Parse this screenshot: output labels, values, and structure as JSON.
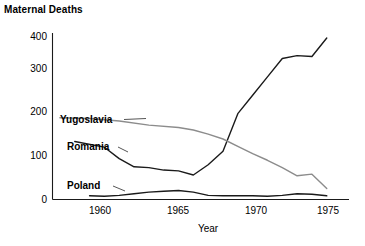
{
  "chart_data": {
    "type": "line",
    "title": "Maternal Deaths",
    "xlabel": "Year",
    "ylabel": "",
    "xlim": [
      1956.5,
      1976.5
    ],
    "ylim": [
      0,
      400
    ],
    "grid": false,
    "legend_position": "inline-annotations",
    "xticks": [
      1960,
      1965,
      1970,
      1975
    ],
    "yticks": [
      0,
      100,
      200,
      300,
      400
    ],
    "xtick_labels": [
      "1960",
      "1965",
      "1970",
      "1975"
    ],
    "ytick_labels": [
      "0",
      "100",
      "200",
      "300",
      "400"
    ],
    "series": [
      {
        "name": "Romania",
        "color": "#1a1a1a",
        "x": [
          1958,
          1960,
          1961,
          1962,
          1963,
          1964,
          1965,
          1966,
          1967,
          1968,
          1969,
          1970,
          1971,
          1972,
          1973,
          1974,
          1975
        ],
        "values": [
          142,
          128,
          100,
          80,
          78,
          72,
          70,
          60,
          85,
          118,
          210,
          255,
          300,
          345,
          352,
          350,
          395
        ]
      },
      {
        "name": "Yugoslavia",
        "color": "#8c8c8c",
        "x": [
          1957,
          1959,
          1961,
          1963,
          1965,
          1966,
          1967,
          1968,
          1969,
          1970,
          1971,
          1972,
          1973,
          1974,
          1975
        ],
        "values": [
          200,
          198,
          192,
          182,
          176,
          170,
          160,
          148,
          130,
          112,
          96,
          78,
          58,
          62,
          27
        ]
      },
      {
        "name": "Poland",
        "color": "#1a1a1a",
        "x": [
          1959,
          1960,
          1961,
          1962,
          1963,
          1964,
          1965,
          1966,
          1967,
          1968,
          1969,
          1970,
          1971,
          1972,
          1973,
          1974,
          1975
        ],
        "values": [
          9,
          8,
          10,
          14,
          18,
          20,
          22,
          18,
          10,
          9,
          9,
          9,
          8,
          10,
          14,
          13,
          9
        ]
      }
    ],
    "annotations": [
      {
        "text": "Yugoslavia",
        "series": "Yugoslavia"
      },
      {
        "text": "Romania",
        "series": "Romania"
      },
      {
        "text": "Poland",
        "series": "Poland"
      }
    ]
  }
}
